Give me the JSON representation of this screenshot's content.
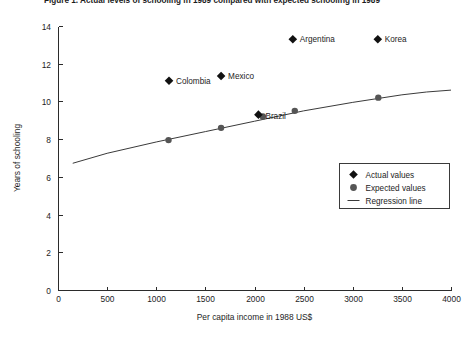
{
  "chart_data": {
    "type": "scatter",
    "title": "Figure 1. Actual levels of schooling in 1989 compared with expected schooling in 1989",
    "xlabel": "Per capita income in 1988 US$",
    "ylabel": "Years of schooling",
    "xlim": [
      0,
      4000
    ],
    "ylim": [
      0,
      14
    ],
    "xticks": [
      0,
      500,
      1000,
      1500,
      2000,
      2500,
      3000,
      3500,
      4000
    ],
    "yticks": [
      0,
      2,
      4,
      6,
      8,
      10,
      12,
      14
    ],
    "grid": false,
    "legend_position": "lower right",
    "legend": [
      {
        "label": "Actual values",
        "marker": "diamond",
        "color": "#111111"
      },
      {
        "label": "Expected values",
        "marker": "circle",
        "color": "#555555"
      },
      {
        "label": "Regression line",
        "marker": "line",
        "color": "#3a3a3a"
      }
    ],
    "series": [
      {
        "name": "Actual values",
        "marker": "diamond",
        "points": [
          {
            "country": "Colombia",
            "x": 1130,
            "y": 11.1,
            "label": "Colombia",
            "label_dx": 7,
            "label_dy": 3
          },
          {
            "country": "Mexico",
            "x": 1660,
            "y": 11.35,
            "label": "Mexico",
            "label_dx": 7,
            "label_dy": 3
          },
          {
            "country": "Brazil",
            "x": 2040,
            "y": 9.3,
            "label": "Brazil",
            "label_dx": 7,
            "label_dy": 4
          },
          {
            "country": "Argentina",
            "x": 2390,
            "y": 13.3,
            "label": "Argentina",
            "label_dx": 7,
            "label_dy": 3
          },
          {
            "country": "Korea",
            "x": 3255,
            "y": 13.3,
            "label": "Korea",
            "label_dx": 7,
            "label_dy": 3
          }
        ]
      },
      {
        "name": "Expected values",
        "marker": "circle",
        "points": [
          {
            "country": "Colombia",
            "x": 1125,
            "y": 7.95
          },
          {
            "country": "Mexico",
            "x": 1660,
            "y": 8.6
          },
          {
            "country": "Brazil",
            "x": 2085,
            "y": 9.2
          },
          {
            "country": "Argentina",
            "x": 2410,
            "y": 9.5
          },
          {
            "country": "Korea",
            "x": 3260,
            "y": 10.2
          }
        ]
      }
    ],
    "regression_line": {
      "name": "Regression line",
      "points": [
        {
          "x": 150,
          "y": 6.72
        },
        {
          "x": 500,
          "y": 7.25
        },
        {
          "x": 1000,
          "y": 7.85
        },
        {
          "x": 1500,
          "y": 8.4
        },
        {
          "x": 2000,
          "y": 8.95
        },
        {
          "x": 2500,
          "y": 9.5
        },
        {
          "x": 3000,
          "y": 9.95
        },
        {
          "x": 3500,
          "y": 10.35
        },
        {
          "x": 3750,
          "y": 10.5
        },
        {
          "x": 4000,
          "y": 10.6
        }
      ]
    }
  }
}
